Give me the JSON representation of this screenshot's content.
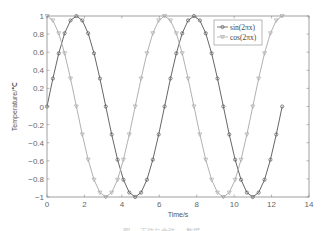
{
  "chart_data": {
    "type": "line",
    "title": "",
    "xlabel": "Time/s",
    "ylabel": "Temperature/℃",
    "xlim": [
      0,
      14
    ],
    "ylim": [
      -1,
      1
    ],
    "xticks": [
      0,
      2,
      4,
      6,
      8,
      10,
      12,
      14
    ],
    "yticks": [
      -1,
      -0.8,
      -0.6,
      -0.4,
      -0.2,
      0,
      0.2,
      0.4,
      0.6,
      0.8,
      1
    ],
    "ytick_labels": [
      "-1",
      "-0.8",
      "-0.6",
      "-0.4",
      "-0.2",
      "0",
      "0.2",
      "0.4",
      "0.6",
      "0.8",
      "1"
    ],
    "grid": false,
    "legend_position": "upper right",
    "x_step": 0.3141592653589793,
    "x_points": 41,
    "series": [
      {
        "name": "sin(2πx)",
        "func": "sin",
        "color": "#555555",
        "marker": "circle"
      },
      {
        "name": "cos(2πx)",
        "func": "cos",
        "color": "#a8a8a8",
        "marker": "triangle-down"
      }
    ],
    "caption": "图 … 正弦与余弦 … 数据"
  },
  "colors": {
    "axis": "#888888",
    "background": "#ffffff"
  }
}
